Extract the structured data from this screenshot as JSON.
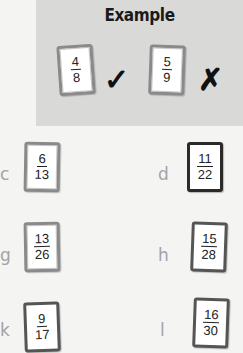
{
  "example": {
    "title": "Example",
    "cards": [
      {
        "numerator": "4",
        "denominator": "8",
        "mark": "✓",
        "mark_icon": "checkmark-icon"
      },
      {
        "numerator": "5",
        "denominator": "9",
        "mark": "✗",
        "mark_icon": "cross-icon"
      }
    ]
  },
  "items": [
    {
      "label": "c",
      "numerator": "6",
      "denominator": "13"
    },
    {
      "label": "d",
      "numerator": "11",
      "denominator": "22"
    },
    {
      "label": "g",
      "numerator": "13",
      "denominator": "26"
    },
    {
      "label": "h",
      "numerator": "15",
      "denominator": "28"
    },
    {
      "label": "k",
      "numerator": "9",
      "denominator": "17"
    },
    {
      "label": "l",
      "numerator": "16",
      "denominator": "30"
    }
  ]
}
